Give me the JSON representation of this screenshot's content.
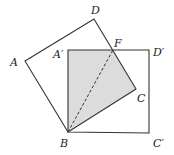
{
  "diagram": {
    "type": "geometry",
    "labels": {
      "A": "A",
      "B": "B",
      "C": "C",
      "D": "D",
      "A_prime": "A′",
      "C_prime": "C′",
      "D_prime": "D′",
      "F": "F"
    },
    "points": {
      "A": [
        25,
        61
      ],
      "B": [
        68,
        132
      ],
      "C": [
        136,
        89
      ],
      "D": [
        94,
        19
      ],
      "A_prime": [
        68,
        50
      ],
      "C_prime": [
        149,
        133
      ],
      "D_prime": [
        149,
        50
      ],
      "F": [
        113,
        50
      ]
    },
    "colors": {
      "shade": "#dcdcdc",
      "line": "#333333"
    }
  }
}
